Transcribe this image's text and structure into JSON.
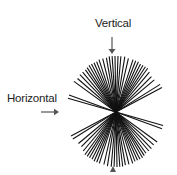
{
  "labels": {
    "vertical": "Vertical",
    "horizontal": "Horizontal"
  },
  "figure": {
    "center": [
      116,
      112
    ],
    "ray_angles_deg_from_vertical": [
      -62,
      -58,
      -50,
      -45,
      -40,
      -36,
      -33,
      -30,
      -27,
      -24,
      -21,
      -18,
      -13,
      -9,
      -5,
      -2,
      1,
      4,
      7,
      10,
      14,
      18,
      21,
      24,
      27,
      30,
      33,
      36,
      40,
      44,
      49,
      54,
      70,
      74
    ],
    "ray_lengths": [
      52,
      52,
      50,
      50,
      52,
      54,
      54,
      54,
      54,
      55,
      55,
      55,
      55,
      56,
      56,
      56,
      56,
      56,
      56,
      55,
      55,
      55,
      54,
      54,
      54,
      54,
      53,
      52,
      52,
      52,
      51,
      52,
      50,
      50
    ],
    "line_color": "#111111",
    "arrow_color": "#555555"
  }
}
